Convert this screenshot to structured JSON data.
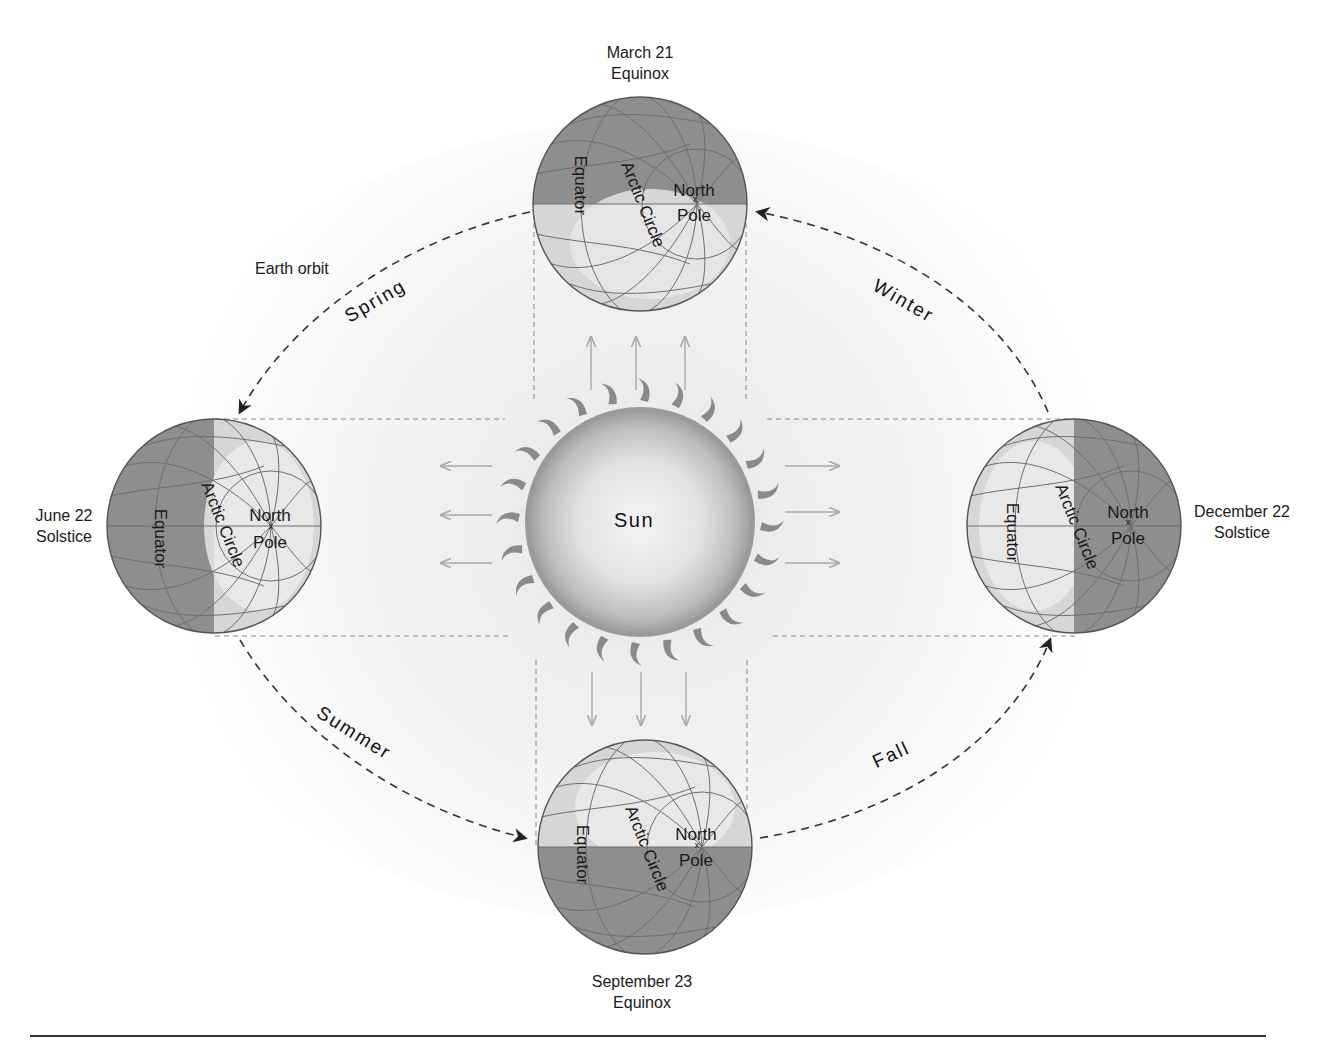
{
  "figure": {
    "orbit_label": "Earth orbit",
    "sun_label": "Sun"
  },
  "positions": [
    {
      "id": "march",
      "date": "March 21",
      "event": "Equinox",
      "lit_side": "bottom"
    },
    {
      "id": "june",
      "date": "June 22",
      "event": "Solstice",
      "lit_side": "right"
    },
    {
      "id": "december",
      "date": "December 22",
      "event": "Solstice",
      "lit_side": "left"
    },
    {
      "id": "september",
      "date": "September 23",
      "event": "Equinox",
      "lit_side": "top"
    }
  ],
  "globe_labels": {
    "equator": "Equator",
    "arctic_circle": "Arctic Circle",
    "north": "North",
    "pole": "Pole",
    "pole_marker": "x"
  },
  "seasons": {
    "spring": "Spring",
    "summer": "Summer",
    "fall": "Fall",
    "winter": "Winter"
  },
  "colors": {
    "night_shade": "#8e8e8e",
    "day_shade": "#d4d4d4",
    "day_highlight": "#ececec",
    "grid_line": "#6e6e6e",
    "orbit_dash": "#333333",
    "sunlight_arrow": "#a8a8a8",
    "sun_core": "#f2f2f2",
    "sun_edge": "#9a9a9a",
    "background": "#ffffff"
  }
}
